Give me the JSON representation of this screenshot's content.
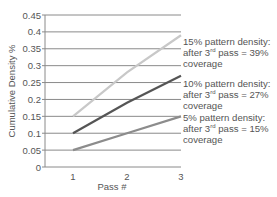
{
  "chart_data": {
    "type": "line",
    "title": "",
    "xlabel": "Pass #",
    "ylabel": "Cumulative Density %",
    "x": [
      1,
      2,
      3
    ],
    "xticks": [
      "1",
      "2",
      "3"
    ],
    "yticks": [
      "0",
      "0.05",
      "0.1",
      "0.15",
      "0.2",
      "0.25",
      "0.3",
      "0.35",
      "0.4",
      "0.45"
    ],
    "ylim": [
      0,
      0.45
    ],
    "grid": true,
    "series": [
      {
        "name": "15% pattern density",
        "values": [
          0.15,
          0.28,
          0.39
        ],
        "color": "#c8c8c8"
      },
      {
        "name": "10% pattern density",
        "values": [
          0.1,
          0.19,
          0.27
        ],
        "color": "#555555"
      },
      {
        "name": "5% pattern density",
        "values": [
          0.05,
          0.1,
          0.15
        ],
        "color": "#8c8c8c"
      }
    ],
    "annotations": [
      {
        "line1": "15% pattern density:",
        "pre": "after 3",
        "sup": "rd",
        "post": " pass = 39%",
        "line3": "coverage"
      },
      {
        "line1": "10% pattern density:",
        "pre": "after 3",
        "sup": "rd",
        "post": " pass = 27%",
        "line3": "coverage"
      },
      {
        "line1": "5% pattern density:",
        "pre": "after 3",
        "sup": "rd",
        "post": " pass = 15%",
        "line3": "coverage"
      }
    ]
  }
}
